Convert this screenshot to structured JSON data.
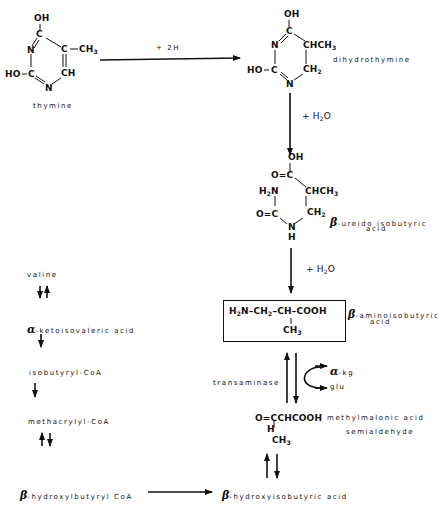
{
  "thymine": {
    "atoms": {
      "oh_top": "OH",
      "c4": "C",
      "n3": "N",
      "c5": "C",
      "ch3": "CH",
      "ch3_sub": "3",
      "ho": "HO",
      "c2": "C",
      "c6": "CH",
      "n1": "N"
    },
    "name": "thymine"
  },
  "step1": {
    "reagent": "+ 2H"
  },
  "dihydrothymine": {
    "atoms": {
      "oh_top": "OH",
      "c4": "C",
      "n3": "N",
      "chch3": "CHCH",
      "chch3_sub": "3",
      "ho": "HO",
      "c2": "C",
      "ch2": "CH",
      "ch2_sub": "2",
      "n1": "N"
    },
    "name": "dihydrothymine"
  },
  "step2": {
    "reagent_prefix": "+ H",
    "reagent_sub": "2",
    "reagent_suffix": "O"
  },
  "ureido": {
    "atoms": {
      "oh": "OH",
      "o_eq_c": "O=C",
      "h2n": "H",
      "h2n_sub": "2",
      "h2n_n": "N",
      "chch3": "CHCH",
      "chch3_sub": "3",
      "o_c": "O=C",
      "ch2": "CH",
      "ch2_sub": "2",
      "n": "N",
      "h": "H"
    },
    "greek": "β",
    "name_line1": "-ureido isobutyric",
    "name_line2": "acid"
  },
  "step3": {
    "reagent_prefix": "+ H",
    "reagent_sub": "2",
    "reagent_suffix": "O"
  },
  "aminoisobutyric": {
    "formula_parts": [
      "H",
      "2",
      "N–CH",
      "2",
      "–CH–COOH"
    ],
    "branch": "CH",
    "branch_sub": "3",
    "greek": "β",
    "name_line1": "-aminoisobutyric",
    "name_line2": "acid"
  },
  "transamination": {
    "enzyme": "transaminase",
    "product1_greek": "α",
    "product1": "-kg",
    "product2": "glu"
  },
  "semialdehyde": {
    "formula": "O=CCHCOOH",
    "h": "H",
    "branch": "CH",
    "branch_sub": "3",
    "name_line1": "methylmalonic acid",
    "name_line2": "semialdehyde"
  },
  "hydroxyisobutyric": {
    "greek": "β",
    "name": "-hydroxyisobutyric acid"
  },
  "valine_pathway": {
    "items": [
      {
        "label": "valine"
      },
      {
        "greek": "α",
        "label": "-ketoisovaleric acid"
      },
      {
        "label": "isobutyryl-CoA"
      },
      {
        "label": "methacrylyl-CoA"
      },
      {
        "greek": "β",
        "label": "-hydroxylbutyryl CoA"
      }
    ]
  }
}
